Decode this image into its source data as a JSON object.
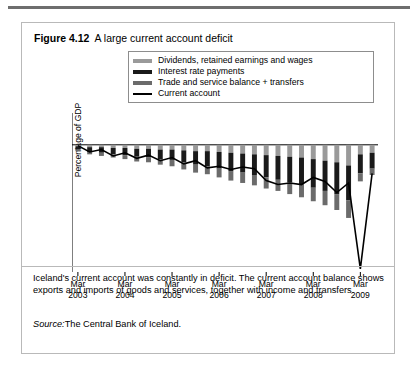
{
  "figure": {
    "number": "Figure 4.12",
    "title": "A large current account deficit"
  },
  "legend": {
    "position": "top-center-inside",
    "items": [
      {
        "label": "Dividends, retained earnings and wages",
        "color": "#9a9a9a"
      },
      {
        "label": "Interest rate payments",
        "color": "#1a1a1a"
      },
      {
        "label": "Trade and service balance + transfers",
        "color": "#6b6b6b"
      },
      {
        "label": "Current account",
        "color": "#000000"
      }
    ]
  },
  "caption": "Iceland's current account was constantly in deficit. The current account balance shows exports and imports of goods and services, together with income and transfers.",
  "source": {
    "word": "Source:",
    "text": "The Central Bank of Iceland."
  },
  "chart_data": {
    "type": "bar",
    "title": "A large current account deficit",
    "xlabel": "",
    "ylabel": "Percentage of GDP",
    "ylim": [
      -80,
      20
    ],
    "yticks": [
      20,
      0,
      -20,
      -40,
      -60,
      -80
    ],
    "ytick_labels": [
      "20",
      "0",
      "–20",
      "–40",
      "–60",
      "–80"
    ],
    "grid": false,
    "legend_position": "upper center",
    "stacked": true,
    "xtick_labels": [
      {
        "month": "Mar",
        "year": "2003"
      },
      {
        "month": "Mar",
        "year": "2004"
      },
      {
        "month": "Mar",
        "year": "2005"
      },
      {
        "month": "Mar",
        "year": "2006"
      },
      {
        "month": "Mar",
        "year": "2007"
      },
      {
        "month": "Mar",
        "year": "2008"
      },
      {
        "month": "Mar",
        "year": "2009"
      }
    ],
    "x": [
      "2003Q1",
      "2003Q2",
      "2003Q3",
      "2003Q4",
      "2004Q1",
      "2004Q2",
      "2004Q3",
      "2004Q4",
      "2005Q1",
      "2005Q2",
      "2005Q3",
      "2005Q4",
      "2006Q1",
      "2006Q2",
      "2006Q3",
      "2006Q4",
      "2007Q1",
      "2007Q2",
      "2007Q3",
      "2007Q4",
      "2008Q1",
      "2008Q2",
      "2008Q3",
      "2008Q4",
      "2009Q1",
      "2009Q2"
    ],
    "series": [
      {
        "name": "Dividends, retained earnings and wages",
        "color": "#9a9a9a",
        "values": [
          -1.0,
          -1.5,
          -1.5,
          -2.0,
          -2.0,
          -2.5,
          -2.5,
          -3.0,
          -3.0,
          -3.5,
          -4.0,
          -4.0,
          -4.5,
          -5.0,
          -5.5,
          -6.0,
          -6.5,
          -7.0,
          -7.5,
          -8.0,
          -9.0,
          -10.0,
          -11.0,
          -13.0,
          -6.0,
          -5.0
        ]
      },
      {
        "name": "Interest rate payments",
        "color": "#1a1a1a",
        "values": [
          -2.0,
          -3.0,
          -3.5,
          -4.0,
          -4.5,
          -5.0,
          -5.5,
          -6.0,
          -6.5,
          -7.5,
          -8.5,
          -9.5,
          -10.5,
          -11.5,
          -12.0,
          -13.0,
          -14.0,
          -15.0,
          -16.0,
          -17.0,
          -18.0,
          -19.0,
          -20.0,
          -22.0,
          -12.0,
          -10.0
        ]
      },
      {
        "name": "Trade and service balance + transfers",
        "color": "#6b6b6b",
        "values": [
          -1.0,
          -1.5,
          -2.0,
          -2.0,
          -2.5,
          -3.0,
          -3.0,
          -3.5,
          -4.0,
          -4.5,
          -5.0,
          -5.0,
          -5.5,
          -6.0,
          -6.5,
          -6.5,
          -7.0,
          -7.0,
          -7.5,
          -8.0,
          -8.5,
          -9.0,
          -10.0,
          -11.0,
          -5.0,
          -4.0
        ]
      }
    ],
    "line_series": {
      "name": "Current account",
      "color": "#000000",
      "values": [
        -0.5,
        -4.5,
        -3.0,
        -7.0,
        -5.0,
        -8.5,
        -6.5,
        -10.0,
        -8.0,
        -12.0,
        -10.0,
        -14.5,
        -13.5,
        -15.5,
        -14.0,
        -15.0,
        -22.5,
        -25.0,
        -24.0,
        -25.0,
        -20.5,
        -23.0,
        -30.0,
        -24.0,
        -78.0,
        -18.0
      ]
    }
  }
}
